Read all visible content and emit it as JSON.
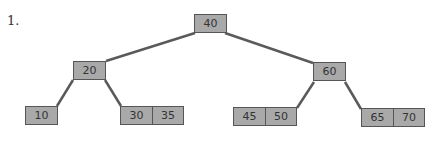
{
  "problem_label": "1.",
  "tree": {
    "type": "2-3 tree",
    "colors": {
      "node_fill": "#a9a9a9",
      "node_border": "#555555",
      "edge": "#5a5a5a"
    },
    "nodes": [
      {
        "id": "root",
        "keys": [
          "40"
        ]
      },
      {
        "id": "left",
        "keys": [
          "20"
        ]
      },
      {
        "id": "right",
        "keys": [
          "60"
        ]
      },
      {
        "id": "leaf1",
        "keys": [
          "10"
        ]
      },
      {
        "id": "leaf2",
        "keys": [
          "30",
          "35"
        ]
      },
      {
        "id": "leaf3",
        "keys": [
          "45",
          "50"
        ]
      },
      {
        "id": "leaf4",
        "keys": [
          "65",
          "70"
        ]
      }
    ],
    "edges": [
      [
        "root",
        "left"
      ],
      [
        "root",
        "right"
      ],
      [
        "left",
        "leaf1"
      ],
      [
        "left",
        "leaf2"
      ],
      [
        "right",
        "leaf3"
      ],
      [
        "right",
        "leaf4"
      ]
    ]
  }
}
